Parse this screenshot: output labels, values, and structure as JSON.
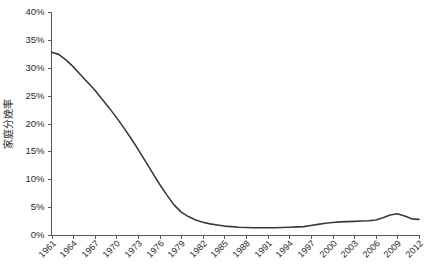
{
  "chart_data": {
    "type": "line",
    "title": "",
    "subtitle": "",
    "xlabel": "",
    "ylabel": "家庭分娩率",
    "xlim": [
      1961,
      2012
    ],
    "ylim": [
      0,
      40
    ],
    "grid": false,
    "legend": false,
    "legend_position": "none",
    "line_color": "#3a3a3a",
    "axis_color": "#595959",
    "y_tick_labels": [
      "40%",
      "35%",
      "30%",
      "25%",
      "20%",
      "15%",
      "10%",
      "5%",
      "0%"
    ],
    "y_tick_values": [
      40,
      35,
      30,
      25,
      20,
      15,
      10,
      5,
      0
    ],
    "x_tick_labels": [
      "1961",
      "1964",
      "1967",
      "1970",
      "1973",
      "1976",
      "1979",
      "1982",
      "1985",
      "1988",
      "1991",
      "1994",
      "1997",
      "2000",
      "2003",
      "2006",
      "2009",
      "2012"
    ],
    "x_tick_values": [
      1961,
      1964,
      1967,
      1970,
      1973,
      1976,
      1979,
      1982,
      1985,
      1988,
      1991,
      1994,
      1997,
      2000,
      2003,
      2006,
      2009,
      2012
    ],
    "series": [
      {
        "name": "家庭分娩率",
        "x": [
          1961,
          1962,
          1963,
          1964,
          1965,
          1966,
          1967,
          1968,
          1969,
          1970,
          1971,
          1972,
          1973,
          1974,
          1975,
          1976,
          1977,
          1978,
          1979,
          1980,
          1981,
          1982,
          1983,
          1984,
          1985,
          1986,
          1987,
          1988,
          1989,
          1990,
          1991,
          1992,
          1993,
          1994,
          1995,
          1996,
          1997,
          1998,
          1999,
          2000,
          2001,
          2002,
          2003,
          2004,
          2005,
          2006,
          2007,
          2008,
          2009,
          2010,
          2011,
          2012
        ],
        "values": [
          32.8,
          32.4,
          31.4,
          30.2,
          28.8,
          27.4,
          26.0,
          24.4,
          22.8,
          21.1,
          19.3,
          17.4,
          15.4,
          13.3,
          11.2,
          9.1,
          7.2,
          5.4,
          4.1,
          3.3,
          2.7,
          2.3,
          2.0,
          1.8,
          1.6,
          1.5,
          1.4,
          1.35,
          1.3,
          1.3,
          1.3,
          1.3,
          1.35,
          1.4,
          1.45,
          1.5,
          1.7,
          1.9,
          2.1,
          2.25,
          2.35,
          2.4,
          2.45,
          2.5,
          2.55,
          2.7,
          3.1,
          3.6,
          3.8,
          3.4,
          2.9,
          2.8
        ]
      }
    ]
  },
  "caption": {
    "text": ""
  }
}
